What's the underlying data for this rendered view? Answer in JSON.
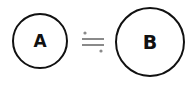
{
  "diagram": {
    "nodes": [
      {
        "id": "A",
        "label": "A",
        "shape": "circle",
        "size": "small"
      },
      {
        "id": "B",
        "label": "B",
        "shape": "circle",
        "size": "large"
      }
    ],
    "relation": {
      "symbol": "≒",
      "name": "approximately-equal",
      "color": "#888888"
    },
    "colors": {
      "stroke": "#111111",
      "background": "#ffffff"
    }
  }
}
